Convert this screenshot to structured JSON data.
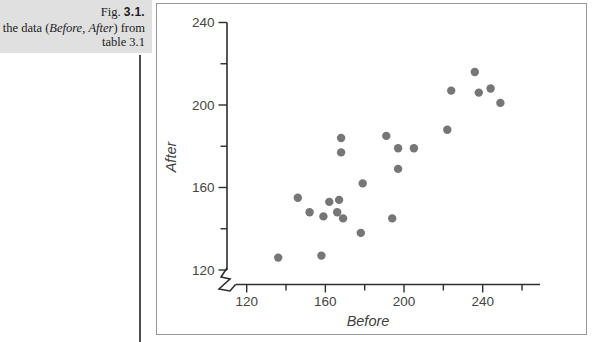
{
  "figure": {
    "label_prefix": "Fig. ",
    "label_number": "3.1.",
    "caption_line2": {
      "prefix": "of the data (",
      "before_word": "Before",
      "separator": ", ",
      "after_word": "After",
      "suffix": ") from"
    },
    "caption_line3": "table 3.1"
  },
  "chart_data": {
    "type": "scatter",
    "title": "",
    "xlabel": "Before",
    "ylabel": "After",
    "x_ticks": [
      120,
      160,
      200,
      240
    ],
    "x_minor_ticks": [
      140,
      180,
      220,
      260
    ],
    "y_ticks": [
      120,
      160,
      200,
      240
    ],
    "y_minor_ticks": [
      140,
      180,
      220
    ],
    "xlim": [
      113,
      269
    ],
    "ylim": [
      113,
      242
    ],
    "axis_break": true,
    "grid": false,
    "marker": "filled-circle",
    "points": [
      [
        136,
        126
      ],
      [
        146,
        155
      ],
      [
        152,
        148
      ],
      [
        158,
        127
      ],
      [
        159,
        146
      ],
      [
        162,
        153
      ],
      [
        166,
        148
      ],
      [
        167,
        154
      ],
      [
        168,
        184
      ],
      [
        168,
        177
      ],
      [
        169,
        145
      ],
      [
        178,
        138
      ],
      [
        179,
        162
      ],
      [
        191,
        185
      ],
      [
        194,
        145
      ],
      [
        197,
        179
      ],
      [
        197,
        169
      ],
      [
        205,
        179
      ],
      [
        222,
        188
      ],
      [
        224,
        207
      ],
      [
        236,
        216
      ],
      [
        238,
        206
      ],
      [
        244,
        208
      ],
      [
        249,
        201
      ]
    ]
  },
  "colors": {
    "caption_bg": "#e0e0e0",
    "caption_text": "#1c1c1c",
    "rule": "#4d4d4d",
    "frame_border": "#979797",
    "axis": "#2e2e2e",
    "tick_label": "#454545",
    "dot": "#767676"
  }
}
